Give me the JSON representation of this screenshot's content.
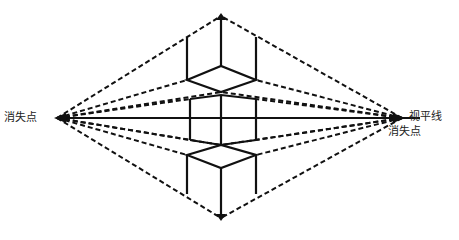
{
  "diagram": {
    "colors": {
      "line": "#111111",
      "background": "#ffffff"
    },
    "labels": {
      "left_vanishing_point": "消失点",
      "right_vanishing_point": "消失点",
      "horizon_line": "视平线"
    },
    "vanishing_points": {
      "left": [
        57,
        118
      ],
      "right": [
        402,
        118
      ]
    },
    "horizon": {
      "y": 118,
      "x1": 57,
      "x2": 420
    },
    "boxes": [
      {
        "name": "box-above-horizon",
        "view": "bottom visible"
      },
      {
        "name": "box-on-horizon",
        "view": "front faces only"
      },
      {
        "name": "box-below-horizon",
        "view": "top visible"
      }
    ]
  }
}
